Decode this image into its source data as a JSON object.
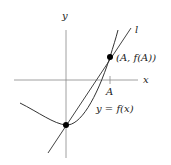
{
  "diagram": {
    "axes": {
      "x_label": "x",
      "y_label": "y"
    },
    "curve": {
      "label": "y = f(x)"
    },
    "line": {
      "label": "l"
    },
    "point_tangent": {
      "label": "(A, f(A))"
    },
    "tick": {
      "label": "A"
    },
    "colors": {
      "axis": "#888888",
      "curve": "#333333",
      "line": "#444444",
      "point": "#000000"
    }
  }
}
